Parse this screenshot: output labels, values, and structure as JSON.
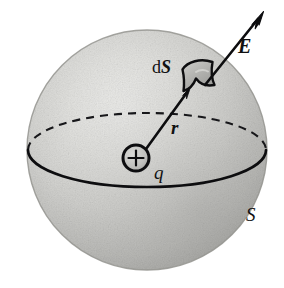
{
  "figure": {
    "background_color": "#ffffff",
    "width": 284,
    "height": 288,
    "sphere": {
      "name": "gaussian-surface-sphere",
      "center_x": 147,
      "center_y": 150,
      "radius": 120,
      "fill_light": "#e8e8e6",
      "fill_mid": "#c9c9c6",
      "fill_dark": "#a5a5a2",
      "outline_color": "#8e8e8b"
    },
    "equator": {
      "name": "equator-ellipse",
      "center_x": 147,
      "center_y": 150,
      "rx": 119,
      "ry": 37,
      "front_style": "solid",
      "back_style": "dashed",
      "stroke_color": "#151515"
    },
    "charge": {
      "center_x": 136,
      "center_y": 158,
      "radius": 13,
      "sign_glyph": "+",
      "fill": "#c0c0bd",
      "stroke": "#111111"
    },
    "r_vector": {
      "from_x": 145,
      "from_y": 149,
      "to_x": 190,
      "to_y": 88,
      "stroke": "#111111"
    },
    "e_vector": {
      "from_x": 206,
      "from_y": 84,
      "to_x": 264,
      "to_y": 12,
      "stroke": "#111111"
    },
    "patch": {
      "name": "surface-element-patch",
      "fill": "#b4b4b1",
      "stroke": "#111111"
    },
    "labels": {
      "field": "E",
      "area_element_prefix": "d",
      "area_element_symbol": "S",
      "radius": "r",
      "charge": "q",
      "surface": "S"
    },
    "label_positions": {
      "field": {
        "x": 238,
        "y": 36
      },
      "area_element": {
        "x": 152,
        "y": 58
      },
      "radius": {
        "x": 171,
        "y": 118
      },
      "charge": {
        "x": 154,
        "y": 163
      },
      "surface": {
        "x": 246,
        "y": 205
      }
    }
  }
}
